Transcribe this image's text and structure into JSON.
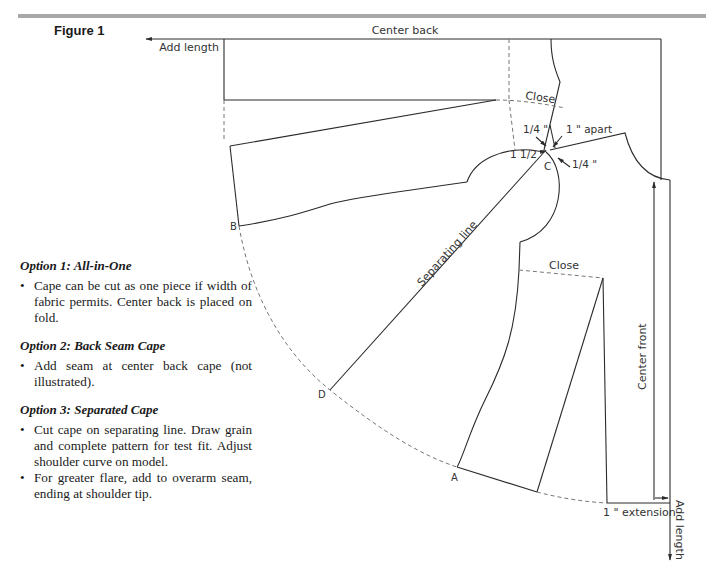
{
  "figure": {
    "title": "Figure 1"
  },
  "labels": {
    "center_back": "Center back",
    "add_length_top": "Add length",
    "close_top": "Close",
    "close_bottom": "Close",
    "quarter_left": "1/4 \"",
    "one_apart": "1 \" apart",
    "one_half": "1 1/2 \"",
    "quarter_right": "1/4 \"",
    "point_c": "C",
    "point_b": "B",
    "point_d": "D",
    "point_a": "A",
    "separating_line": "Separating line",
    "center_front": "Center front",
    "extension": "1 \" extension",
    "add_length_side": "Add length"
  },
  "options": [
    {
      "heading_prefix": "Option 1: ",
      "heading_title": "All-in-One",
      "bullets": [
        "Cape can be cut as one piece if width of fabric permits. Center back is placed on fold."
      ]
    },
    {
      "heading_prefix": "Option 2: ",
      "heading_title": "Back Seam Cape",
      "bullets": [
        "Add seam at center back cape (not illustrated)."
      ]
    },
    {
      "heading_prefix": "Option 3: ",
      "heading_title": "Separated Cape",
      "bullets": [
        "Cut cape on separating line. Draw grain and complete pattern for test fit. Adjust shoulder curve on model.",
        "For greater flare, add to overarm seam, ending at shoulder tip."
      ]
    }
  ],
  "colors": {
    "line": "#2b2b2b",
    "dashed": "#777777",
    "rule": "#a8a8a8"
  }
}
